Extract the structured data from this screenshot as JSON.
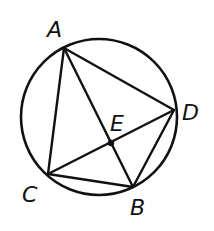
{
  "diagram": {
    "type": "circle-inscribed-quadrilateral",
    "circle": {
      "cx": 99,
      "cy": 117,
      "r": 78
    },
    "stroke_color": "#111111",
    "points": {
      "A": {
        "x": 64,
        "y": 48,
        "label": "A",
        "lx": 47,
        "ly": 37
      },
      "D": {
        "x": 174,
        "y": 110,
        "label": "D",
        "lx": 182,
        "ly": 120
      },
      "C": {
        "x": 48,
        "y": 174,
        "label": "C",
        "lx": 22,
        "ly": 202
      },
      "B": {
        "x": 133,
        "y": 187,
        "label": "B",
        "lx": 130,
        "ly": 215
      },
      "E": {
        "x": 111,
        "y": 143,
        "label": "E",
        "lx": 110,
        "ly": 131
      }
    },
    "segments": [
      "AD",
      "AC",
      "AB",
      "CD",
      "CB",
      "DB"
    ],
    "labels": {
      "A": "A",
      "B": "B",
      "C": "C",
      "D": "D",
      "E": "E"
    }
  }
}
